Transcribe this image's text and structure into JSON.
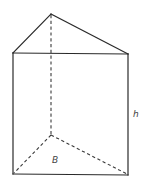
{
  "figure": {
    "type": "triangular-prism",
    "labels": {
      "height": "h",
      "base": "B"
    },
    "colors": {
      "solid_edge": "#2a2a2a",
      "hidden_edge": "#3a3a3a",
      "label": "#444444",
      "background": "#ffffff"
    }
  }
}
